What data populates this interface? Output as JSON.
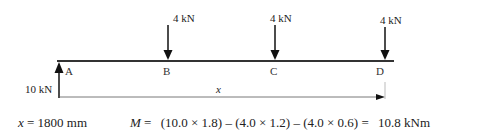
{
  "diagram": {
    "type": "beam-free-body",
    "beam": {
      "color": "#333333"
    },
    "points": [
      {
        "id": "A",
        "label": "A"
      },
      {
        "id": "B",
        "label": "B"
      },
      {
        "id": "C",
        "label": "C"
      },
      {
        "id": "D",
        "label": "D"
      }
    ],
    "loads": [
      {
        "at": "B",
        "label": "4 kN",
        "direction": "down"
      },
      {
        "at": "C",
        "label": "4 kN",
        "direction": "down"
      },
      {
        "at": "D",
        "label": "4 kN",
        "direction": "down"
      }
    ],
    "reaction": {
      "at": "A",
      "label": "10 kN",
      "direction": "up"
    },
    "dimension": {
      "label": "x",
      "from": "A",
      "to": "D"
    }
  },
  "equation": {
    "x_var": "x",
    "x_value": " = 1800 mm",
    "m_var": "M",
    "m_eq": " =",
    "m_expr": "(10.0 × 1.8) – (4.0 × 1.2) – (4.0 × 0.6) =",
    "m_result": "10.8 kNm"
  }
}
